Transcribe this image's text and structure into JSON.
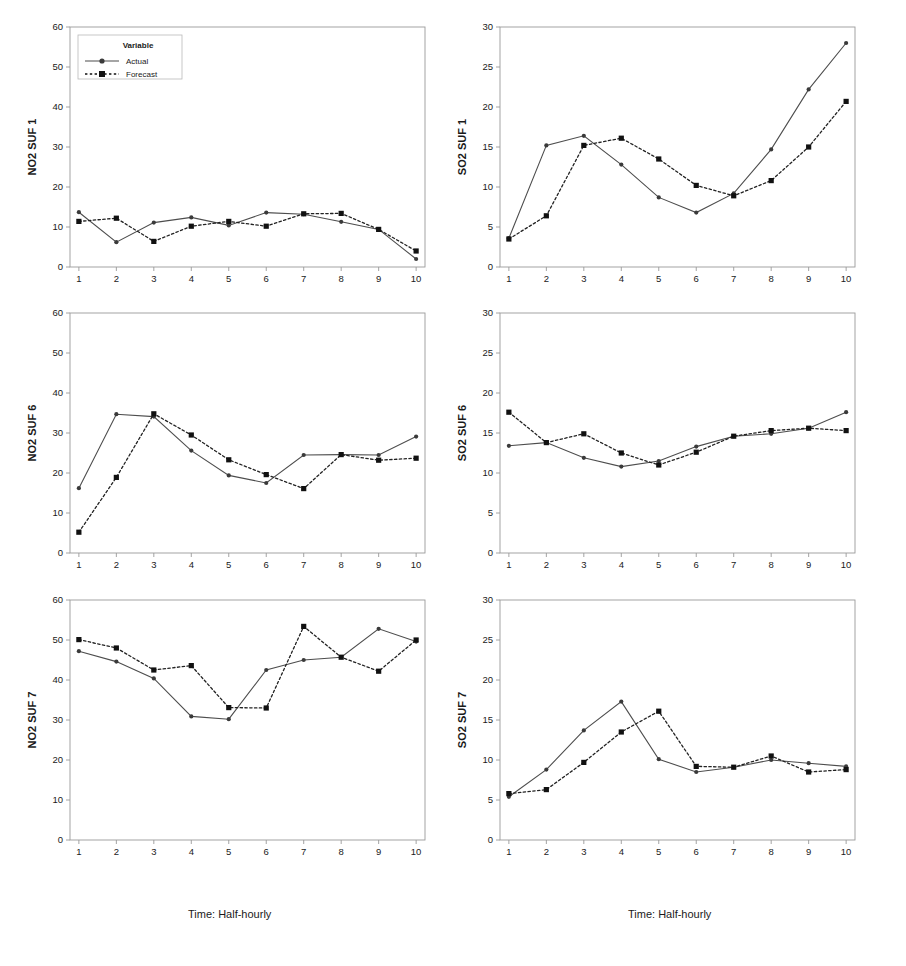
{
  "figure": {
    "xlabel_left": "Time: Half-hourly",
    "xlabel_right": "Time: Half-hourly",
    "legend": {
      "title": "Variable",
      "entries": [
        {
          "label": "Actual",
          "style": "solid-line-circle-marker",
          "color": "#4d4d4d"
        },
        {
          "label": "Forecast",
          "style": "dotted-line-square-marker",
          "color": "#111111"
        }
      ]
    }
  },
  "chart_data": [
    {
      "type": "line",
      "title": "",
      "ylabel": "NO2 SUF 1",
      "xlabel": "Time: Half-hourly",
      "x": [
        1,
        2,
        3,
        4,
        5,
        6,
        7,
        8,
        9,
        10
      ],
      "xticklabels": [
        "1",
        "2",
        "3",
        "4",
        "5",
        "6",
        "7",
        "8",
        "9",
        "10"
      ],
      "yticks": [
        0,
        10,
        20,
        30,
        40,
        50,
        60
      ],
      "ylim": [
        0,
        60
      ],
      "grid": false,
      "legend_position": "top-left",
      "series": [
        {
          "name": "Actual",
          "values": [
            13.7,
            6.2,
            11.1,
            12.4,
            10.4,
            13.6,
            13.2,
            11.3,
            9.4,
            2.0
          ]
        },
        {
          "name": "Forecast",
          "values": [
            11.4,
            12.2,
            6.4,
            10.2,
            11.4,
            10.2,
            13.3,
            13.4,
            9.4,
            4.0
          ]
        }
      ]
    },
    {
      "type": "line",
      "title": "",
      "ylabel": "SO2 SUF 1",
      "xlabel": "Time: Half-hourly",
      "x": [
        1,
        2,
        3,
        4,
        5,
        6,
        7,
        8,
        9,
        10
      ],
      "xticklabels": [
        "1",
        "2",
        "3",
        "4",
        "5",
        "6",
        "7",
        "8",
        "9",
        "10"
      ],
      "yticks": [
        0,
        5,
        10,
        15,
        20,
        25,
        30
      ],
      "ylim": [
        0,
        30
      ],
      "grid": false,
      "legend_position": "none",
      "series": [
        {
          "name": "Actual",
          "values": [
            3.6,
            15.2,
            16.4,
            12.8,
            8.7,
            6.8,
            9.2,
            14.7,
            22.2,
            28.0
          ]
        },
        {
          "name": "Forecast",
          "values": [
            3.5,
            6.4,
            15.2,
            16.1,
            13.5,
            10.2,
            8.9,
            10.8,
            15.0,
            20.7
          ]
        }
      ]
    },
    {
      "type": "line",
      "title": "",
      "ylabel": "NO2 SUF 6",
      "xlabel": "Time: Half-hourly",
      "x": [
        1,
        2,
        3,
        4,
        5,
        6,
        7,
        8,
        9,
        10
      ],
      "xticklabels": [
        "1",
        "2",
        "3",
        "4",
        "5",
        "6",
        "7",
        "8",
        "9",
        "10"
      ],
      "yticks": [
        0,
        10,
        20,
        30,
        40,
        50,
        60
      ],
      "ylim": [
        0,
        60
      ],
      "grid": false,
      "legend_position": "none",
      "series": [
        {
          "name": "Actual",
          "values": [
            16.2,
            34.7,
            34.1,
            25.6,
            19.4,
            17.5,
            24.5,
            24.6,
            24.5,
            29.1
          ]
        },
        {
          "name": "Forecast",
          "values": [
            5.2,
            18.9,
            34.8,
            29.5,
            23.3,
            19.6,
            16.1,
            24.6,
            23.2,
            23.7
          ]
        }
      ]
    },
    {
      "type": "line",
      "title": "",
      "ylabel": "SO2 SUF 6",
      "xlabel": "Time: Half-hourly",
      "x": [
        1,
        2,
        3,
        4,
        5,
        6,
        7,
        8,
        9,
        10
      ],
      "xticklabels": [
        "1",
        "2",
        "3",
        "4",
        "5",
        "6",
        "7",
        "8",
        "9",
        "10"
      ],
      "yticks": [
        0,
        5,
        10,
        15,
        20,
        25,
        30
      ],
      "ylim": [
        0,
        30
      ],
      "grid": false,
      "legend_position": "none",
      "series": [
        {
          "name": "Actual",
          "values": [
            13.4,
            13.8,
            11.9,
            10.8,
            11.5,
            13.3,
            14.6,
            14.9,
            15.6,
            17.6
          ]
        },
        {
          "name": "Forecast",
          "values": [
            17.6,
            13.8,
            14.9,
            12.5,
            11.0,
            12.6,
            14.6,
            15.3,
            15.6,
            15.3
          ]
        }
      ]
    },
    {
      "type": "line",
      "title": "",
      "ylabel": "NO2 SUF 7",
      "xlabel": "Time: Half-hourly",
      "x": [
        1,
        2,
        3,
        4,
        5,
        6,
        7,
        8,
        9,
        10
      ],
      "xticklabels": [
        "1",
        "2",
        "3",
        "4",
        "5",
        "6",
        "7",
        "8",
        "9",
        "10"
      ],
      "yticks": [
        0,
        10,
        20,
        30,
        40,
        50,
        60
      ],
      "ylim": [
        0,
        60
      ],
      "grid": false,
      "legend_position": "none",
      "series": [
        {
          "name": "Actual",
          "values": [
            47.2,
            44.6,
            40.4,
            30.9,
            30.2,
            42.5,
            45.0,
            45.7,
            52.8,
            49.6
          ]
        },
        {
          "name": "Forecast",
          "values": [
            50.1,
            48.0,
            42.5,
            43.6,
            33.1,
            33.0,
            53.4,
            45.7,
            42.2,
            50.0
          ]
        }
      ]
    },
    {
      "type": "line",
      "title": "",
      "ylabel": "SO2 SUF 7",
      "xlabel": "Time: Half-hourly",
      "x": [
        1,
        2,
        3,
        4,
        5,
        6,
        7,
        8,
        9,
        10
      ],
      "xticklabels": [
        "1",
        "2",
        "3",
        "4",
        "5",
        "6",
        "7",
        "8",
        "9",
        "10"
      ],
      "yticks": [
        0,
        5,
        10,
        15,
        20,
        25,
        30
      ],
      "ylim": [
        0,
        30
      ],
      "grid": false,
      "legend_position": "none",
      "series": [
        {
          "name": "Actual",
          "values": [
            5.4,
            8.8,
            13.7,
            17.3,
            10.1,
            8.5,
            9.1,
            10.0,
            9.6,
            9.2
          ]
        },
        {
          "name": "Forecast",
          "values": [
            5.8,
            6.3,
            9.7,
            13.5,
            16.1,
            9.2,
            9.1,
            10.5,
            8.5,
            8.8
          ]
        }
      ]
    }
  ]
}
